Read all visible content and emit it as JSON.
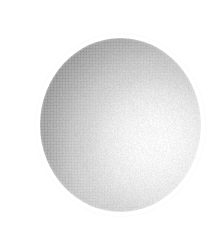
{
  "image": {
    "kind": "halftone-illustration",
    "subject": "sphere",
    "caption": "",
    "background_color": "#ffffff",
    "width": 222,
    "height": 230
  },
  "sphere": {
    "label": "sphere",
    "center_x": 120,
    "center_y": 125,
    "radius_x": 80,
    "radius_y": 87,
    "bounds": {
      "left": 40,
      "top": 38,
      "right": 201,
      "bottom": 212
    },
    "base_color": "#c9c9c9",
    "shadow_color": "#979797",
    "midtone_color": "#c4c4c4",
    "highlight_color": "#fbfbfb",
    "outline_color": "#9a9a9a"
  },
  "lighting": {
    "label": "specular-highlight",
    "direction": "lower-right",
    "highlight_x": 160,
    "highlight_y": 140,
    "terminator_side": "upper-left"
  },
  "texture": {
    "label": "halftone-dot-screen",
    "pattern": "halftone",
    "cell_size_px": 3,
    "dot_color": "#3c3c3c"
  }
}
